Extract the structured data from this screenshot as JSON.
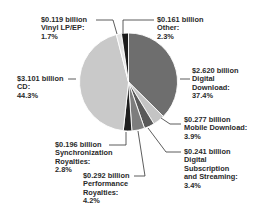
{
  "chart_data": {
    "type": "pie",
    "title": "",
    "start_angle_deg": 0,
    "direction": "clockwise",
    "slices": [
      {
        "name": "Digital Download",
        "value_label": "$2.620 billion",
        "value": 2.62,
        "percent": 37.4,
        "color": "#6e6e6e"
      },
      {
        "name": "Mobile Download",
        "value_label": "$0.277 billion",
        "value": 0.277,
        "percent": 3.9,
        "color": "#c4c4c4"
      },
      {
        "name": "Digital Subscription and Streaming",
        "value_label": "$0.241 billion",
        "value": 0.241,
        "percent": 3.4,
        "color": "#5a5a5a"
      },
      {
        "name": "Performance Royalties",
        "value_label": "$0.292 billion",
        "value": 0.292,
        "percent": 4.2,
        "color": "#7d7d7d"
      },
      {
        "name": "Synchronization Royalties",
        "value_label": "$0.196 billion",
        "value": 0.196,
        "percent": 2.8,
        "color": "#1e1e1e"
      },
      {
        "name": "CD",
        "value_label": "$3.101 billion",
        "value": 3.101,
        "percent": 44.3,
        "color": "#c9c9c9"
      },
      {
        "name": "Vinyl LP/EP",
        "value_label": "$0.119 billion",
        "value": 0.119,
        "percent": 1.7,
        "color": "#e2e2e2"
      },
      {
        "name": "Other",
        "value_label": "$0.161 billion",
        "value": 0.161,
        "percent": 2.3,
        "color": "#1a1a1a"
      }
    ]
  },
  "labels": {
    "vinyl": {
      "line1": "$0.119 billion",
      "line2": "Vinyl LP/EP:",
      "line3": "1.7%"
    },
    "other": {
      "line1": "$0.161 billion",
      "line2": "Other:",
      "line3": "2.3%"
    },
    "digital": {
      "line1": "$2.620 billion",
      "line2": "Digital",
      "line3": "Download:",
      "line4": "37.4%"
    },
    "cd": {
      "line1": "$3.101 billion",
      "line2": "CD:",
      "line3": "44.3%"
    },
    "mobile": {
      "line1": "$0.277 billion",
      "line2": "Mobile Download:",
      "line3": "3.9%"
    },
    "sync": {
      "line1": "$0.196 billion",
      "line2": "Synchronization",
      "line3": "Royalties:",
      "line4": "2.8%"
    },
    "stream": {
      "line1": "$0.241 billion",
      "line2": "Digital",
      "line3": "Subscription",
      "line4": "and Streaming:",
      "line5": "3.4%"
    },
    "perf": {
      "line1": "$0.292 billion",
      "line2": "Performance",
      "line3": "Royalties:",
      "line4": "4.2%"
    }
  }
}
